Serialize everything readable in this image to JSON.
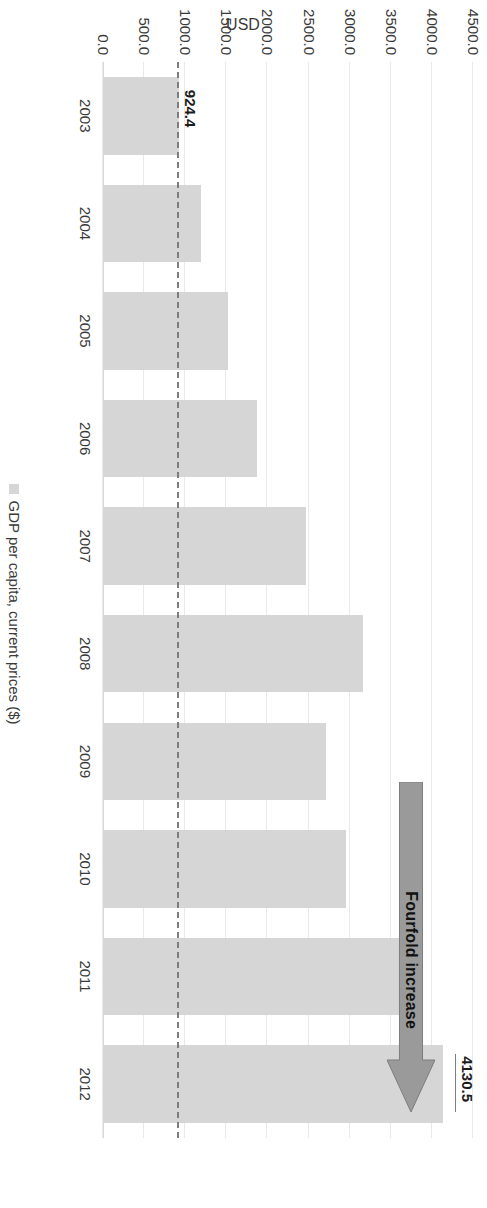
{
  "chart_data": {
    "type": "bar",
    "title": "",
    "xlabel": "",
    "ylabel": "USD",
    "ylim": [
      0,
      4500
    ],
    "ytick_step": 500,
    "ytick_labels": [
      "4500.0",
      "4000.0",
      "3500.0",
      "3000.0",
      "2500.0",
      "2000.0",
      "1500.0",
      "1000.0",
      "500.0",
      "0.0"
    ],
    "grid": true,
    "legend_position": "bottom",
    "categories": [
      "2003",
      "2004",
      "2005",
      "2006",
      "2007",
      "2008",
      "2009",
      "2010",
      "2011",
      "2012"
    ],
    "series": [
      {
        "name": "GDP per capita, current prices ($)",
        "values": [
          924.4,
          1195.0,
          1520.0,
          1875.0,
          2470.0,
          3165.0,
          2715.0,
          2960.0,
          3735.0,
          4130.5
        ]
      }
    ],
    "data_labels": [
      {
        "category": "2003",
        "value": 924.4,
        "text": "924.4"
      },
      {
        "category": "2012",
        "value": 4130.5,
        "text": "4130.5"
      }
    ],
    "reference_line": {
      "value": 924.4,
      "label": "924.4",
      "style": "dash-dot"
    },
    "annotations": [
      {
        "text": "Fourfold increase",
        "shape": "arrow",
        "direction": "up-to-2012"
      }
    ]
  },
  "legend": {
    "entries": [
      {
        "label": "GDP per capita, current prices ($)",
        "color": "#d6d6d6"
      }
    ]
  },
  "colors": {
    "bar": "#d6d6d6",
    "arrow_fill": "#9a9a9a",
    "arrow_stroke": "#7d7d7d",
    "gridline": "#e9e9e9",
    "text": "#3a3a3a"
  }
}
